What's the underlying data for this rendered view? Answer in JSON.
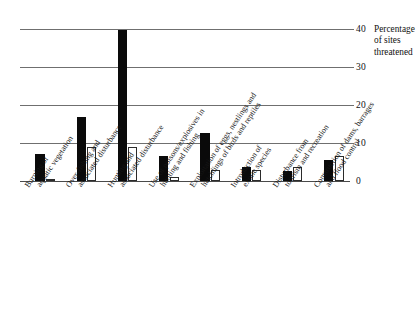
{
  "chart_data": {
    "type": "bar",
    "title": "",
    "xlabel": "",
    "ylabel": "Percentage of sites threatened",
    "ylim": [
      0,
      42
    ],
    "yticks": [
      0,
      10,
      20,
      30,
      40
    ],
    "grid": true,
    "legend": "none",
    "categories": [
      "Burning of aquatic vegetation",
      "Over-fishing and associated disturbance",
      "Hunting and associated disturbance",
      "Use of poisons/explosives in hunting and fishing",
      "Exploitation of eggs, nestlings and hatchlings of birds and reptiles",
      "Introduction of exotic species",
      "Disturbance from tourism and recreation",
      "Construction of dams, barrages and flood control"
    ],
    "series": [
      {
        "name": "grey",
        "color": "#9a9a9a",
        "values": [
          4.3,
          31.2,
          39.0,
          0.9,
          2.5,
          2.5,
          12.6,
          3.6
        ]
      },
      {
        "name": "black",
        "color": "#0a0a0a",
        "values": [
          7.5,
          17.6,
          41.8,
          6.9,
          13.2,
          3.9,
          2.8,
          5.8
        ]
      },
      {
        "name": "white",
        "color": "#ffffff",
        "values": [
          0.6,
          9.5,
          9.5,
          1.0,
          3.0,
          3.0,
          4.0,
          6.9
        ]
      }
    ]
  },
  "axis": {
    "title_line1": "Percentage",
    "title_line2": "of sites",
    "title_line3": "threatened",
    "tick_40": "40",
    "tick_30": "30",
    "tick_20": "20",
    "tick_10": "10",
    "tick_0": "0"
  },
  "cat_lines": [
    {
      "l1": "Burning of",
      "l2": "aquatic vegetation"
    },
    {
      "l1": "Over-fishing and",
      "l2": "associated disturbance"
    },
    {
      "l1": "Hunting and",
      "l2": "associated disturbance"
    },
    {
      "l1": "Use of poisons/explosives in",
      "l2": "hunting and fishing"
    },
    {
      "l1": "Exploitation of eggs, nestlings and",
      "l2": "hatchlings of birds and reptiles"
    },
    {
      "l1": "Introduction of",
      "l2": "exotic species"
    },
    {
      "l1": "Disturbance from",
      "l2": "tourism and recreation"
    },
    {
      "l1": "Construction of dams, barrages",
      "l2": "and flood control"
    }
  ]
}
